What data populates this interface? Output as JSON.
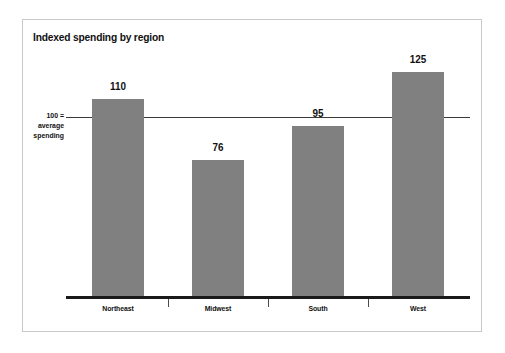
{
  "chart_data": {
    "type": "bar",
    "title": "Indexed spending by region",
    "categories": [
      "Northeast",
      "Midwest",
      "South",
      "West"
    ],
    "values": [
      110,
      76,
      95,
      125
    ],
    "xlabel": "",
    "ylabel": "",
    "ylim": [
      0,
      140
    ],
    "grid": false,
    "legend": false,
    "reference_line": {
      "value": 100,
      "label_line1": "100 =",
      "label_line2": "average",
      "label_line3": "spending"
    },
    "bar_color": "#808080",
    "axis_color": "#1a1a1a",
    "text_color": "#111111",
    "background": "#ffffff",
    "frame_color": "#c9c9c9"
  },
  "labels": {
    "value_0": "110",
    "value_1": "76",
    "value_2": "95",
    "value_3": "125",
    "cat_0": "Northeast",
    "cat_1": "Midwest",
    "cat_2": "South",
    "cat_3": "West"
  }
}
